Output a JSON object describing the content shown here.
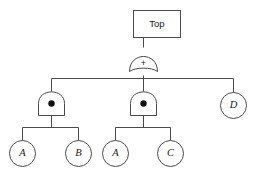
{
  "diagram": {
    "type": "fault-tree",
    "title_node": {
      "label": "Top",
      "shape": "rectangle"
    },
    "gates": [
      {
        "id": "or-root",
        "type": "OR",
        "symbol": "+",
        "label": "+"
      },
      {
        "id": "and-left",
        "type": "AND",
        "symbol": "dot",
        "label": "●"
      },
      {
        "id": "and-middle",
        "type": "AND",
        "symbol": "dot",
        "label": "●"
      }
    ],
    "basic_events": [
      {
        "id": "event-a-left",
        "label": "A",
        "shape": "circle"
      },
      {
        "id": "event-b",
        "label": "B",
        "shape": "circle"
      },
      {
        "id": "event-a-right",
        "label": "A",
        "shape": "circle"
      },
      {
        "id": "event-c",
        "label": "C",
        "shape": "circle"
      },
      {
        "id": "event-d",
        "label": "D",
        "shape": "circle"
      }
    ],
    "colors": {
      "line": "#4a4a4a",
      "fill": "#ffffff",
      "text": "#1a1a1a",
      "dot": "#111111"
    }
  }
}
